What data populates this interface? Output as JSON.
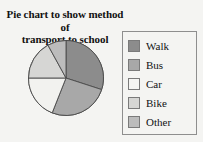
{
  "chart_data": {
    "type": "pie",
    "title": "Pie chart to show method of transport to school",
    "title_line1": "Pie chart to show method of",
    "title_line2": "transport to school",
    "categories": [
      "Walk",
      "Bus",
      "Car",
      "Bike",
      "Other"
    ],
    "values": [
      30,
      26,
      19,
      17,
      8
    ],
    "unit": "percent",
    "start_angle_deg": 0,
    "direction": "clockwise",
    "legend_position": "right",
    "grid": false,
    "xlabel": "",
    "ylabel": "",
    "slice_colors": [
      "#8c8c8c",
      "#a8a8a8",
      "#f2f2ef",
      "#d6d6d4",
      "#bcbcbc"
    ],
    "slice_border_color": "#4a4a4a",
    "slices": [
      {
        "label": "Walk",
        "value": 30,
        "color": "#8c8c8c",
        "start_deg": 0,
        "end_deg": 108
      },
      {
        "label": "Bus",
        "value": 26,
        "color": "#a8a8a8",
        "start_deg": 108,
        "end_deg": 201.6
      },
      {
        "label": "Car",
        "value": 19,
        "color": "#f2f2ef",
        "start_deg": 201.6,
        "end_deg": 270
      },
      {
        "label": "Bike",
        "value": 17,
        "color": "#d6d6d4",
        "start_deg": 270,
        "end_deg": 331.2
      },
      {
        "label": "Other",
        "value": 8,
        "color": "#bcbcbc",
        "start_deg": 331.2,
        "end_deg": 360
      }
    ]
  },
  "legend": {
    "items": [
      {
        "label": "Walk",
        "color": "#8c8c8c"
      },
      {
        "label": "Bus",
        "color": "#a8a8a8"
      },
      {
        "label": "Car",
        "color": "#f4f4f2"
      },
      {
        "label": "Bike",
        "color": "#d6d6d4"
      },
      {
        "label": "Other",
        "color": "#bcbcbc"
      }
    ]
  }
}
